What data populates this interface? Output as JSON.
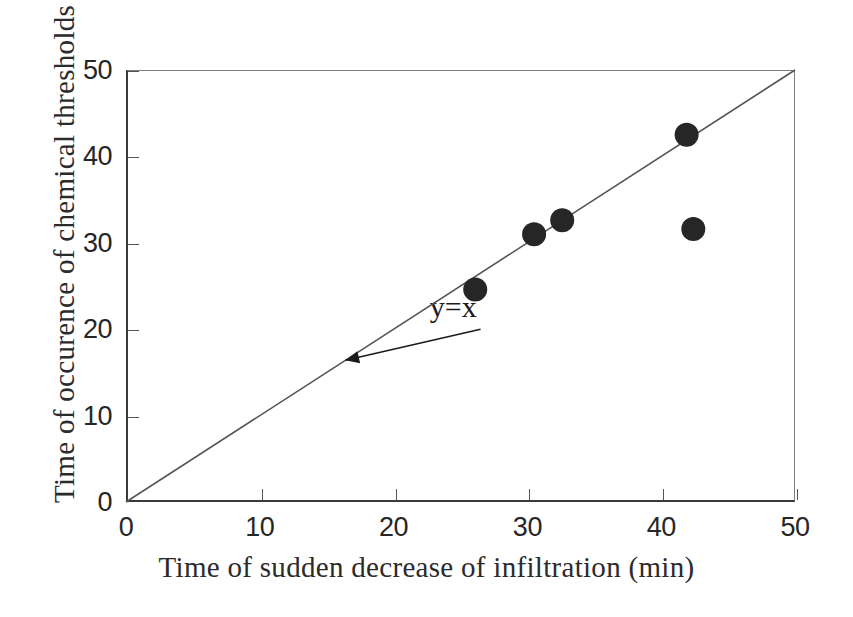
{
  "chart_data": {
    "type": "scatter",
    "title": "",
    "xlabel": "Time of sudden decrease of infiltration (min)",
    "ylabel": "Time of occurence of chemical thresholds",
    "xlim": [
      0,
      50
    ],
    "ylim": [
      0,
      50
    ],
    "xticks": [
      "0",
      "10",
      "20",
      "30",
      "40",
      "50"
    ],
    "yticks": [
      "0",
      "10",
      "20",
      "30",
      "40",
      "50"
    ],
    "xtick_values": [
      0,
      10,
      20,
      30,
      40,
      50
    ],
    "ytick_values": [
      0,
      10,
      20,
      30,
      40,
      50
    ],
    "grid": false,
    "legend": null,
    "marker_style": "filled-circle",
    "marker_color": "#262626",
    "points": [
      {
        "x": 26.1,
        "y": 24.6
      },
      {
        "x": 30.5,
        "y": 31.0
      },
      {
        "x": 32.6,
        "y": 32.6
      },
      {
        "x": 41.9,
        "y": 42.5
      },
      {
        "x": 42.4,
        "y": 31.6
      }
    ],
    "series": [
      {
        "name": "observations",
        "x": [
          26.1,
          30.5,
          32.6,
          41.9,
          42.4
        ],
        "values": [
          24.6,
          31.0,
          32.6,
          42.5,
          31.6
        ]
      }
    ],
    "reference_line": {
      "label": "y=x",
      "from": {
        "x": 0,
        "y": 0
      },
      "to": {
        "x": 50,
        "y": 50
      },
      "color": "#555555"
    },
    "annotations": [
      {
        "text": "y=x",
        "label_x": 23.0,
        "label_y": 22.0,
        "arrow_from": {
          "x": 26.5,
          "y": 20.0
        },
        "arrow_to": {
          "x": 16.4,
          "y": 16.4
        }
      }
    ]
  },
  "axes": {
    "x_title": "Time of sudden decrease of infiltration (min)",
    "y_title": "Time of occurence of chemical thresholds"
  }
}
